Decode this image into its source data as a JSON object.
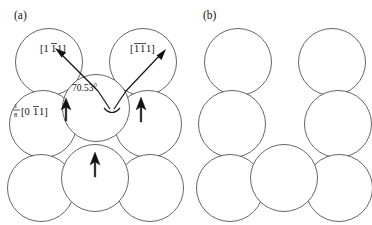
{
  "figure": {
    "background_color": "#ffffff",
    "line_color": "#4a4a4a",
    "ink_color": "#111111",
    "width": 372,
    "height": 225
  },
  "panels": [
    {
      "tag": "(a)",
      "tag_x": 14,
      "tag_y": 19,
      "origin_x": 0,
      "description": "sheared close-packed plane with slip vectors"
    },
    {
      "tag": "(b)",
      "tag_x": 203,
      "tag_y": 19,
      "origin_x": 189,
      "description": "relaxed close-packed plane without vectors"
    }
  ],
  "atoms": {
    "radius": 33.5,
    "panel_a": [
      {
        "cx": 49,
        "cy": 62
      },
      {
        "cx": 143,
        "cy": 62
      },
      {
        "cx": 43,
        "cy": 124
      },
      {
        "cx": 96,
        "cy": 108
      },
      {
        "cx": 148,
        "cy": 124
      },
      {
        "cx": 41,
        "cy": 188
      },
      {
        "cx": 95,
        "cy": 178
      },
      {
        "cx": 150,
        "cy": 188
      }
    ],
    "panel_b": [
      {
        "cx": 238,
        "cy": 62
      },
      {
        "cx": 332,
        "cy": 62
      },
      {
        "cx": 232,
        "cy": 124
      },
      {
        "cx": 338,
        "cy": 124
      },
      {
        "cx": 230,
        "cy": 188
      },
      {
        "cx": 284,
        "cy": 178
      },
      {
        "cx": 339,
        "cy": 188
      }
    ]
  },
  "labels": {
    "miller_left": {
      "open": "[1",
      "barred_1": "1",
      "tail": "1]",
      "x": 40,
      "y": 52,
      "description": "direction index one one-bar one"
    },
    "miller_right": {
      "open": "[",
      "barred_1": "1",
      "barred_2": "1",
      "tail": "1]",
      "x": 130,
      "y": 52,
      "description": "direction index one-bar one-bar one"
    },
    "angle": {
      "text": "70.53°",
      "x": 72,
      "y": 91
    },
    "burgers": {
      "numerator": "1",
      "denominator": "8",
      "bracket_open": "[0",
      "barred": "1",
      "bracket_tail": "1]",
      "x": 14,
      "y": 112,
      "description": "one eighth zero one-bar one partial vector"
    }
  },
  "vectors": {
    "slip_left": {
      "name": "slip-vector-left",
      "x1": 98,
      "y1": 91,
      "x2": 57,
      "y2": 50
    },
    "slip_right": {
      "name": "slip-vector-right",
      "x1": 126,
      "y1": 91,
      "x2": 164,
      "y2": 51
    },
    "angle_leg_left": {
      "x1": 98,
      "y1": 91,
      "x2": 111,
      "y2": 110
    },
    "angle_leg_right": {
      "x1": 126,
      "y1": 91,
      "x2": 113,
      "y2": 110
    },
    "shear_arrows": [
      {
        "name": "shear-arrow-left",
        "x": 66,
        "y": 116
      },
      {
        "name": "shear-arrow-right",
        "x": 141,
        "y": 116
      },
      {
        "name": "shear-arrow-bottom",
        "x": 95,
        "y": 172
      }
    ]
  }
}
